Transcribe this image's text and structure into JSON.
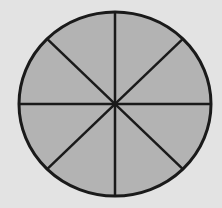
{
  "diagram": {
    "type": "fraction-circle",
    "shape": "circle",
    "total_parts": 8,
    "shaded_parts": 8,
    "center": [
      115,
      104
    ],
    "radius_x": 96,
    "radius_y": 92,
    "colors": {
      "background": "#e3e3e3",
      "fill": "#b3b3b3",
      "stroke": "#1a1a1a"
    }
  }
}
